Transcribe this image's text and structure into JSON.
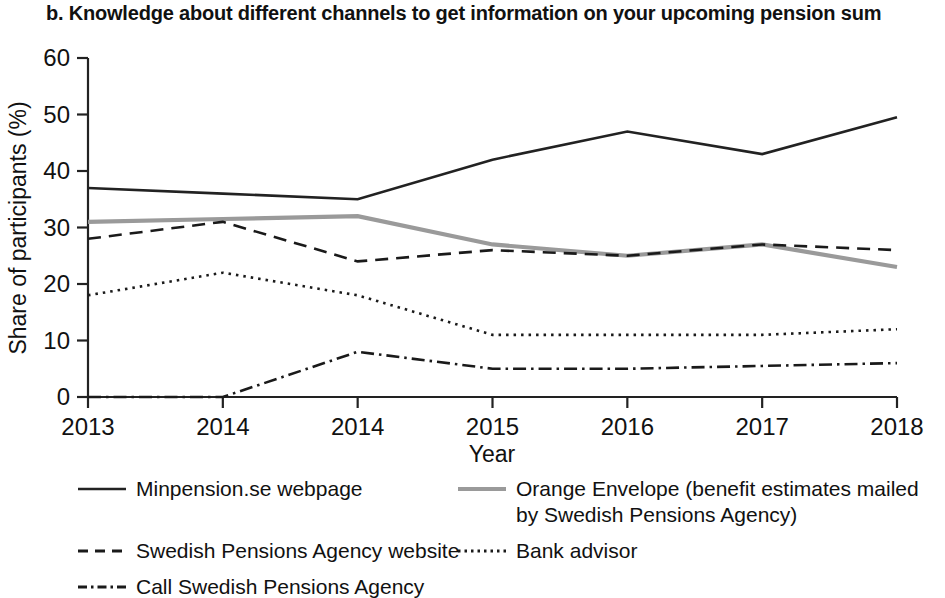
{
  "chart_data": {
    "type": "line",
    "title": "b. Knowledge about different channels to get information on your upcoming pension sum",
    "xlabel": "Year",
    "ylabel": "Share of participants (%)",
    "categories": [
      "2013",
      "2014",
      "2014",
      "2015",
      "2016",
      "2017",
      "2018"
    ],
    "ylim": [
      0,
      60
    ],
    "yticks": [
      0,
      10,
      20,
      30,
      40,
      50,
      60
    ],
    "grid": false,
    "legend_position": "bottom",
    "series": [
      {
        "name": "Minpension.se webpage",
        "style": "solid",
        "color": "#222222",
        "values": [
          37,
          36,
          35,
          42,
          47,
          43,
          49.5
        ]
      },
      {
        "name": "Orange Envelope (benefit estimates mailed\nby Swedish Pensions Agency)",
        "style": "solid",
        "color": "#9a9a9a",
        "values": [
          31,
          31.5,
          32,
          27,
          25,
          27,
          23
        ]
      },
      {
        "name": "Swedish Pensions Agency website",
        "style": "dashed",
        "color": "#1a1a1a",
        "values": [
          28,
          31,
          24,
          26,
          25,
          27,
          26
        ]
      },
      {
        "name": "Bank advisor",
        "style": "dotted",
        "color": "#1a1a1a",
        "values": [
          18,
          22,
          18,
          11,
          11,
          11,
          12
        ]
      },
      {
        "name": "Call Swedish Pensions Agency",
        "style": "dashdot",
        "color": "#1a1a1a",
        "values": [
          0,
          0,
          8,
          5,
          5,
          5.5,
          6
        ]
      }
    ]
  },
  "legend": {
    "minpension_label": "Minpension.se webpage",
    "orange_label": "Orange Envelope (benefit estimates mailed\nby Swedish Pensions Agency)",
    "agency_website_label": "Swedish Pensions Agency website",
    "bank_advisor_label": "Bank advisor",
    "call_agency_label": "Call Swedish Pensions Agency"
  }
}
